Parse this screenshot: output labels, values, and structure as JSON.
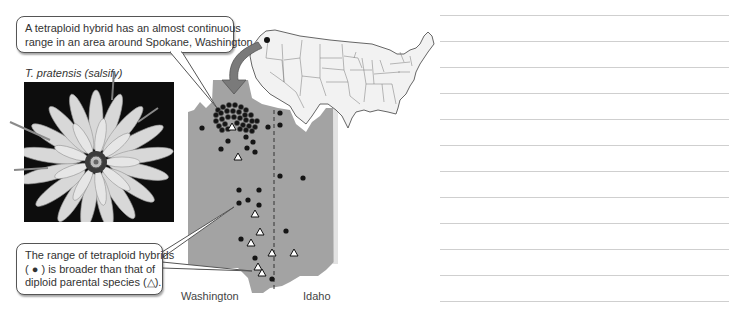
{
  "callouts": {
    "top": {
      "lines": [
        "A tetraploid hybrid has an almost continuous",
        "range in an area around Spokane, Washington."
      ]
    },
    "bottom": {
      "lines": [
        "The range of tetraploid hybrids",
        "( ● ) is broader than that of",
        "diploid parental species (△)."
      ]
    }
  },
  "photo": {
    "caption": "T. pratensis (salsify)",
    "subject": "flower"
  },
  "map": {
    "state_labels": [
      "Washington",
      "Idaho"
    ],
    "legend": {
      "tetraploid_hybrid": "filled-circle",
      "diploid_parent": "open-triangle"
    },
    "colors": {
      "region_fill": "#a3a3a3",
      "us_map_fill": "#f2f2f2",
      "arrow": "#7a7a7a",
      "dot": "#1a1a1a"
    },
    "hybrid_dots": [
      [
        205,
        128
      ],
      [
        223,
        126
      ],
      [
        241,
        127
      ],
      [
        268,
        127
      ],
      [
        281,
        125
      ],
      [
        281,
        113
      ],
      [
        228,
        141
      ],
      [
        221,
        149
      ],
      [
        244,
        137
      ],
      [
        251,
        140
      ],
      [
        254,
        149
      ],
      [
        254,
        157
      ],
      [
        238,
        173
      ],
      [
        259,
        175
      ],
      [
        279,
        176
      ],
      [
        303,
        178
      ],
      [
        239,
        190
      ],
      [
        258,
        190
      ],
      [
        239,
        203
      ],
      [
        248,
        200
      ],
      [
        259,
        203
      ],
      [
        283,
        234
      ],
      [
        241,
        236
      ],
      [
        256,
        246
      ],
      [
        270,
        257
      ],
      [
        273,
        277
      ]
    ],
    "parent_triangles": [
      [
        232,
        128
      ],
      [
        237,
        158
      ],
      [
        255,
        216
      ],
      [
        259,
        234
      ],
      [
        250,
        246
      ],
      [
        271,
        255
      ],
      [
        294,
        254
      ],
      [
        258,
        269
      ],
      [
        262,
        275
      ]
    ]
  },
  "notes": {
    "line_count": 12
  }
}
